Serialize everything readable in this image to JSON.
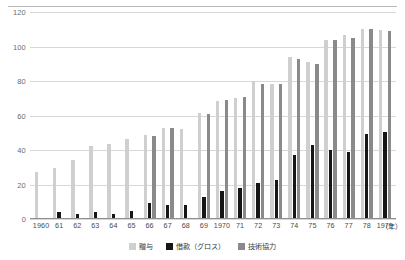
{
  "chart_data": {
    "type": "bar",
    "title": "",
    "subtitle": "",
    "xlabel": "(年)",
    "ylabel": "",
    "ylim": [
      0,
      120
    ],
    "yticks": [
      0,
      20,
      40,
      60,
      80,
      100,
      120
    ],
    "grid": true,
    "legend_position": "bottom-center",
    "categories": [
      "1960",
      "61",
      "62",
      "63",
      "64",
      "65",
      "66",
      "67",
      "68",
      "69",
      "1970",
      "71",
      "72",
      "73",
      "74",
      "75",
      "76",
      "77",
      "78",
      "1979"
    ],
    "series": [
      {
        "name": "贈与",
        "color": "#cfcfcf",
        "values": [
          27.5,
          29.5,
          34.5,
          42.5,
          43.5,
          46.5,
          48.5,
          52.5,
          52.0,
          61.5,
          68.5,
          70.0,
          80.0,
          78.5,
          94.0,
          91.0,
          104.0,
          106.5,
          110.0,
          109.5
        ]
      },
      {
        "name": "借款（グロス）",
        "color": "#161616",
        "values": [
          0.0,
          4.0,
          3.0,
          3.8,
          2.8,
          4.8,
          9.0,
          8.0,
          8.2,
          13.0,
          16.0,
          18.0,
          20.8,
          22.5,
          37.0,
          43.0,
          40.0,
          39.0,
          49.0,
          50.5
        ]
      },
      {
        "name": "技術協力",
        "color": "#8a8a8a",
        "values": [
          0.0,
          0.0,
          0.0,
          0.0,
          0.0,
          0.0,
          48.0,
          53.0,
          0.0,
          61.0,
          69.0,
          71.0,
          78.0,
          78.0,
          93.0,
          90.0,
          104.0,
          105.0,
          110.0,
          109.0
        ]
      }
    ]
  },
  "axis": {
    "y_tick_labels": [
      "0",
      "20",
      "40",
      "60",
      "80",
      "100",
      "120"
    ],
    "x_unit_label": "（年）"
  },
  "legend": {
    "items": [
      {
        "label": "贈与",
        "color": "#cfcfcf"
      },
      {
        "label": "借款（グロス）",
        "color": "#161616"
      },
      {
        "label": "技術協力",
        "color": "#8a8a8a"
      }
    ]
  },
  "colors": {
    "series_grant": "#cfcfcf",
    "series_loan": "#161616",
    "series_tech": "#8a8a8a",
    "gridline": "#d8d8d8",
    "axis": "#8f8f8f",
    "text": "#4a4a4a",
    "background": "#ffffff"
  }
}
